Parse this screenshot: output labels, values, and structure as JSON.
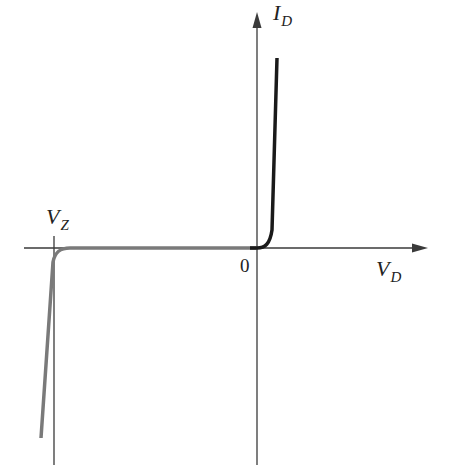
{
  "diagram": {
    "type": "zener-diode-iv-characteristic",
    "axes": {
      "x_label": {
        "main": "V",
        "sub": "D"
      },
      "y_label": {
        "main": "I",
        "sub": "D"
      },
      "origin_label": "0"
    },
    "annotations": {
      "zener_voltage": {
        "main": "V",
        "sub": "Z"
      }
    },
    "curves": [
      {
        "name": "forward-bias",
        "color": "#1a1a1a",
        "description": "sharp rise just right of origin"
      },
      {
        "name": "reverse-bias-breakdown",
        "color": "#7a7a7a",
        "description": "flat near zero then sharp drop at V_Z"
      }
    ],
    "colors": {
      "axis": "#3a3a3a",
      "forward_curve": "#1a1a1a",
      "reverse_curve": "#7a7a7a",
      "background": "#ffffff"
    }
  }
}
